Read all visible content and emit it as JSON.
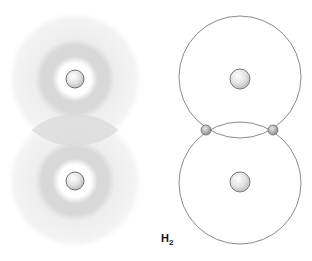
{
  "label": {
    "main": "H",
    "subscript": "2",
    "x": 160,
    "y": 234
  },
  "electron_cloud_model": {
    "atoms": [
      {
        "nucleus": {
          "cx": 75,
          "cy": 79,
          "r": 9
        },
        "cloud_outer_r": 67,
        "ring_inner_r": 20,
        "ring_outer_r": 36
      },
      {
        "nucleus": {
          "cx": 75,
          "cy": 181,
          "r": 9
        },
        "cloud_outer_r": 67,
        "ring_inner_r": 20,
        "ring_outer_r": 36
      }
    ],
    "overlap_region": "shared electron density between atoms"
  },
  "orbit_model": {
    "atoms": [
      {
        "nucleus": {
          "cx": 240,
          "cy": 79,
          "r": 10
        },
        "orbit": {
          "cx": 240,
          "cy": 77,
          "r": 61
        }
      },
      {
        "nucleus": {
          "cx": 240,
          "cy": 182,
          "r": 10
        },
        "orbit": {
          "cx": 240,
          "cy": 183,
          "r": 61
        }
      }
    ],
    "shared_electrons": [
      {
        "cx": 206,
        "cy": 130,
        "r": 5
      },
      {
        "cx": 273,
        "cy": 130,
        "r": 5
      }
    ]
  },
  "colors": {
    "cloud_outer": "#f0f0f0",
    "cloud_ring": "#d6d6d6",
    "overlap": "#dcdcdc",
    "orbit_line": "#8a8a8a",
    "nucleus_fill": "#e6e6e6",
    "nucleus_stroke": "#7a7a7a",
    "electron_fill": "#b0b0b0"
  }
}
